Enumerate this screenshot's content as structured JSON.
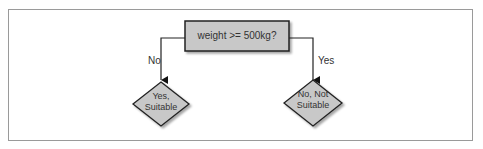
{
  "diagram": {
    "type": "decision-tree",
    "root": {
      "label": "weight >= 500kg?",
      "shape": "rectangle",
      "fill": "#c8c8c8"
    },
    "edges": [
      {
        "label": "No",
        "target": "left"
      },
      {
        "label": "Yes",
        "target": "right"
      }
    ],
    "leaves": {
      "left": {
        "line1": "Yes,",
        "line2": "Suitable",
        "shape": "diamond"
      },
      "right": {
        "line1": "No, Not",
        "line2": "Suitable",
        "shape": "diamond"
      }
    }
  },
  "colors": {
    "node_fill": "#c8c8c8",
    "stroke": "#222222",
    "frame": "#9a9a9a"
  }
}
